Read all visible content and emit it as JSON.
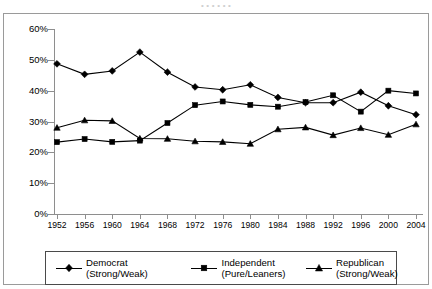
{
  "top_clipped_text": "•      •      •      •      •      •",
  "chart_data": {
    "type": "line",
    "title": "",
    "subtitle": "",
    "xlabel": "",
    "ylabel": "",
    "x": [
      1952,
      1956,
      1960,
      1964,
      1968,
      1972,
      1976,
      1980,
      1984,
      1988,
      1992,
      1996,
      2000,
      2004
    ],
    "categories": [
      "1952",
      "1956",
      "1960",
      "1964",
      "1968",
      "1972",
      "1976",
      "1980",
      "1984",
      "1988",
      "1992",
      "1996",
      "2000",
      "2004"
    ],
    "ylim": [
      0,
      60
    ],
    "ytick_values": [
      0,
      10,
      20,
      30,
      40,
      50,
      60
    ],
    "ytick_labels": [
      "0%",
      "10%",
      "20%",
      "30%",
      "40%",
      "50%",
      "60%"
    ],
    "grid": false,
    "legend_position": "bottom",
    "series": [
      {
        "name": "Democrat (Strong/Weak)",
        "label_line1": "Democrat",
        "label_line2": "(Strong/Weak)",
        "marker": "diamond",
        "color": "#000000",
        "values": [
          48.7,
          45.3,
          46.4,
          52.5,
          46.0,
          41.2,
          40.3,
          41.9,
          37.8,
          36.1,
          36.1,
          39.5,
          35.1,
          32.2
        ]
      },
      {
        "name": "Independent (Pure/Leaners)",
        "label_line1": "Independent",
        "label_line2": "(Pure/Leaners)",
        "marker": "square",
        "color": "#000000",
        "values": [
          23.3,
          24.3,
          23.4,
          23.8,
          29.5,
          35.3,
          36.5,
          35.4,
          34.8,
          36.3,
          38.5,
          33.2,
          40.0,
          39.1
        ]
      },
      {
        "name": "Republican (Strong/Weak)",
        "label_line1": "Republican",
        "label_line2": "(Strong/Weak)",
        "marker": "triangle",
        "color": "#000000",
        "values": [
          28.0,
          30.4,
          30.2,
          24.5,
          24.4,
          23.6,
          23.4,
          22.8,
          27.5,
          28.1,
          25.6,
          27.9,
          25.7,
          29.1
        ]
      }
    ]
  },
  "legend": {
    "items": [
      {
        "line1": "Democrat",
        "line2": "(Strong/Weak)",
        "marker": "diamond"
      },
      {
        "line1": "Independent",
        "line2": "(Pure/Leaners)",
        "marker": "square"
      },
      {
        "line1": "Republican",
        "line2": "(Strong/Weak)",
        "marker": "triangle"
      }
    ]
  }
}
